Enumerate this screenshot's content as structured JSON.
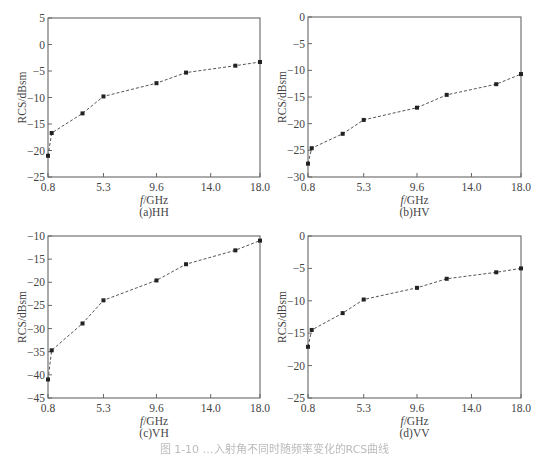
{
  "figure_caption": "图 1-10  …入射角不同时随频率变化的RCS曲线",
  "colors": {
    "axis": "#666666",
    "line": "#555555",
    "marker": "#222222"
  },
  "chart_data": [
    {
      "id": "a",
      "type": "line",
      "title": "(a)HH",
      "xlabel": "f/GHz",
      "ylabel": "RCS/dBsm",
      "xlim": [
        0.8,
        18.0
      ],
      "ylim": [
        -25,
        5
      ],
      "xticks": [
        0.8,
        5.3,
        9.6,
        14.0,
        18.0
      ],
      "xtick_labels": [
        "0.8",
        "5.3",
        "9.6",
        "14.0",
        "18.0"
      ],
      "yticks": [
        5,
        0,
        -5,
        -10,
        -15,
        -20,
        -25
      ],
      "ytick_labels": [
        "5",
        "0",
        "−5",
        "−10",
        "−15",
        "−20",
        "−25"
      ],
      "grid": false,
      "line_style": "dashed",
      "marker": "square",
      "x": [
        0.8,
        1.1,
        3.6,
        5.3,
        9.6,
        12.0,
        16.0,
        18.0
      ],
      "y": [
        -21.0,
        -16.7,
        -13.0,
        -9.8,
        -7.3,
        -5.3,
        -4.0,
        -3.3
      ]
    },
    {
      "id": "b",
      "type": "line",
      "title": "(b)HV",
      "xlabel": "f/GHz",
      "ylabel": "RCS/dBsm",
      "xlim": [
        0.8,
        18.0
      ],
      "ylim": [
        -30,
        0
      ],
      "xticks": [
        0.8,
        5.3,
        9.6,
        14.0,
        18.0
      ],
      "xtick_labels": [
        "0.8",
        "5.3",
        "9.6",
        "14.0",
        "18.0"
      ],
      "yticks": [
        0,
        -5,
        -10,
        -15,
        -20,
        -25,
        -30
      ],
      "ytick_labels": [
        "0",
        "−5",
        "−10",
        "−15",
        "−20",
        "−25",
        "−30"
      ],
      "grid": false,
      "line_style": "dashed",
      "marker": "square",
      "x": [
        0.8,
        1.1,
        3.6,
        5.3,
        9.6,
        12.0,
        16.0,
        18.0
      ],
      "y": [
        -27.5,
        -24.6,
        -21.9,
        -19.3,
        -17.0,
        -14.6,
        -12.6,
        -10.7
      ]
    },
    {
      "id": "c",
      "type": "line",
      "title": "(c)VH",
      "xlabel": "f/GHz",
      "ylabel": "RCS/dBsm",
      "xlim": [
        0.8,
        18.0
      ],
      "ylim": [
        -45,
        -10
      ],
      "xticks": [
        0.8,
        5.3,
        9.6,
        14.0,
        18.0
      ],
      "xtick_labels": [
        "0.8",
        "5.3",
        "9.6",
        "14.0",
        "18.0"
      ],
      "yticks": [
        -10,
        -15,
        -20,
        -25,
        -30,
        -35,
        -40,
        -45
      ],
      "ytick_labels": [
        "−10",
        "−15",
        "−20",
        "−25",
        "−30",
        "−35",
        "−40",
        "−45"
      ],
      "grid": false,
      "line_style": "dashed",
      "marker": "square",
      "x": [
        0.8,
        1.1,
        3.6,
        5.3,
        9.6,
        12.0,
        16.0,
        18.0
      ],
      "y": [
        -41.0,
        -34.7,
        -28.9,
        -23.9,
        -19.6,
        -16.1,
        -13.1,
        -11.0
      ]
    },
    {
      "id": "d",
      "type": "line",
      "title": "(d)VV",
      "xlabel": "f/GHz",
      "ylabel": "RCS/dBsm",
      "xlim": [
        0.8,
        18.0
      ],
      "ylim": [
        -25,
        0
      ],
      "xticks": [
        0.8,
        5.3,
        9.6,
        14.0,
        18.0
      ],
      "xtick_labels": [
        "0.8",
        "5.3",
        "9.6",
        "14.0",
        "18.0"
      ],
      "yticks": [
        0,
        -5,
        -10,
        -15,
        -20,
        -25
      ],
      "ytick_labels": [
        "0",
        "−5",
        "−10",
        "−15",
        "−20",
        "−25"
      ],
      "grid": false,
      "line_style": "dashed",
      "marker": "square",
      "x": [
        0.8,
        1.1,
        3.6,
        5.3,
        9.6,
        12.0,
        16.0,
        18.0
      ],
      "y": [
        -17.1,
        -14.5,
        -11.9,
        -9.8,
        -8.0,
        -6.6,
        -5.6,
        -5.0
      ]
    }
  ]
}
